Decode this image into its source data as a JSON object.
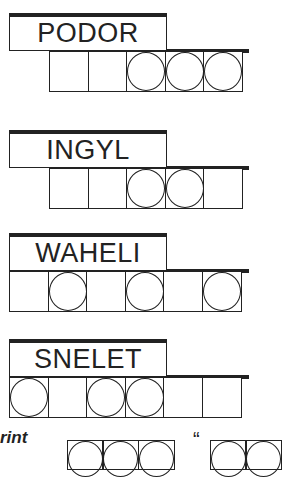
{
  "puzzle": {
    "clues": [
      {
        "scrambled": "PODOR",
        "top": 13,
        "tiles_left": 49,
        "tiles": [
          false,
          false,
          true,
          true,
          true
        ]
      },
      {
        "scrambled": "INGYL",
        "top": 130,
        "tiles_left": 49,
        "tiles": [
          false,
          false,
          true,
          true,
          false
        ]
      },
      {
        "scrambled": "WAHELI",
        "top": 233,
        "tiles_left": 9,
        "tiles": [
          false,
          true,
          false,
          true,
          false,
          true
        ]
      },
      {
        "scrambled": "SNELET",
        "top": 339,
        "tiles_left": 9,
        "tiles": [
          true,
          false,
          true,
          true,
          false,
          false
        ]
      }
    ],
    "footer_label": "rint",
    "answer_quote": "“",
    "answer_tiles_visible": 4
  }
}
